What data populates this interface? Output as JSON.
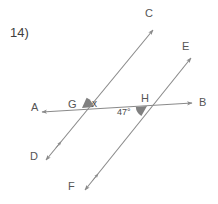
{
  "problem": {
    "number_label": "14)"
  },
  "diagram": {
    "type": "geometry-parallel-lines-transversal",
    "stroke_color": "#8a8a8a",
    "wedge_color": "#808080",
    "text_color": "#4a4a4a",
    "points": {
      "A": {
        "label": "A",
        "x": 31,
        "y": 102
      },
      "B": {
        "label": "B",
        "x": 199,
        "y": 97
      },
      "C": {
        "label": "C",
        "x": 145,
        "y": 8
      },
      "D": {
        "label": "D",
        "x": 30,
        "y": 151
      },
      "E": {
        "label": "E",
        "x": 182,
        "y": 41
      },
      "F": {
        "label": "F",
        "x": 68,
        "y": 181
      },
      "G": {
        "label": "G",
        "x": 68,
        "y": 99
      },
      "H": {
        "label": "H",
        "x": 141,
        "y": 93
      }
    },
    "angles": {
      "at_G": {
        "label": "x",
        "x": 92,
        "y": 99
      },
      "at_H": {
        "label": "47°",
        "x": 117,
        "y": 108
      }
    },
    "lines": [
      {
        "name": "transversal-AB",
        "from": "A",
        "to": "B"
      },
      {
        "name": "parallel-DC",
        "from": "D",
        "to": "C"
      },
      {
        "name": "parallel-FE",
        "from": "F",
        "to": "E"
      }
    ],
    "intersections": [
      {
        "name": "G",
        "x": 82,
        "y": 108
      },
      {
        "name": "H",
        "x": 147,
        "y": 106
      }
    ]
  }
}
